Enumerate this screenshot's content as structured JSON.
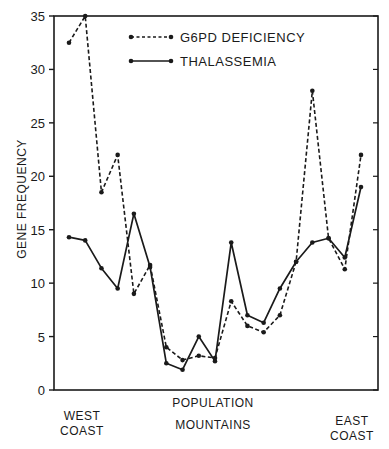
{
  "chart_data": {
    "type": "line",
    "title": "",
    "xlabel": "POPULATION",
    "ylabel": "GENE FREQUENCY",
    "ylim": [
      0,
      35
    ],
    "yticks": [
      0,
      5,
      10,
      15,
      20,
      25,
      30,
      35
    ],
    "grid": false,
    "legend_position": "top-center (inside plot)",
    "x_annotations": [
      {
        "text": "WEST\nCOAST",
        "position": "left"
      },
      {
        "text": "MOUNTAINS",
        "position": "center"
      },
      {
        "text": "EAST\nCOAST",
        "position": "right"
      }
    ],
    "x": [
      1,
      2,
      3,
      4,
      5,
      6,
      7,
      8,
      9,
      10,
      11,
      12,
      13,
      14,
      15,
      16,
      17,
      18,
      19
    ],
    "series": [
      {
        "name": "G6PD DEFICIENCY",
        "style": "dashed",
        "values": [
          32.5,
          35,
          18.5,
          22,
          9,
          11.7,
          4,
          2.8,
          3.2,
          3,
          8.3,
          6,
          5.4,
          7,
          12,
          28,
          14.2,
          11.3,
          22
        ]
      },
      {
        "name": "THALASSEMIA",
        "style": "solid",
        "values": [
          14.3,
          14,
          11.4,
          9.5,
          16.5,
          11.5,
          2.5,
          1.9,
          5,
          2.7,
          13.8,
          7,
          6.3,
          9.5,
          12,
          13.8,
          14.2,
          12.4,
          19
        ]
      }
    ]
  },
  "labels": {
    "ylabel": "GENE FREQUENCY",
    "xlabel": "POPULATION",
    "west_line1": "WEST",
    "west_line2": "COAST",
    "mountains": "MOUNTAINS",
    "east_line1": "EAST",
    "east_line2": "COAST",
    "legend_g6pd": "G6PD DEFICIENCY",
    "legend_thal": "THALASSEMIA"
  }
}
